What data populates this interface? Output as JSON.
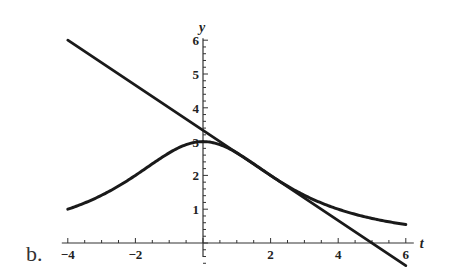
{
  "panel_label": "b.",
  "colors": {
    "curve": "#1a1a1a",
    "axis": "#333333",
    "background": "#ffffff"
  },
  "chart_data": {
    "type": "line",
    "title": "",
    "xlabel": "t",
    "ylabel": "y",
    "xlim": [
      -4,
      6
    ],
    "ylim": [
      0,
      6
    ],
    "x_ticks": [
      -4,
      -2,
      2,
      4,
      6
    ],
    "y_ticks": [
      1,
      2,
      3,
      4,
      5,
      6
    ],
    "grid": false,
    "legend": null,
    "series": [
      {
        "name": "curve",
        "description": "bell-shaped curve, peak 3 at t=0",
        "x": [
          -4,
          -3,
          -2,
          -1,
          0,
          1,
          2,
          3,
          4,
          5,
          6
        ],
        "values": [
          1.0,
          1.41,
          2.0,
          2.67,
          3.0,
          2.67,
          2.0,
          1.41,
          1.0,
          0.73,
          0.55
        ]
      },
      {
        "name": "tangent line",
        "description": "tangent to curve at t=2",
        "x": [
          -4,
          6
        ],
        "values": [
          6.0,
          -0.67
        ]
      }
    ]
  }
}
